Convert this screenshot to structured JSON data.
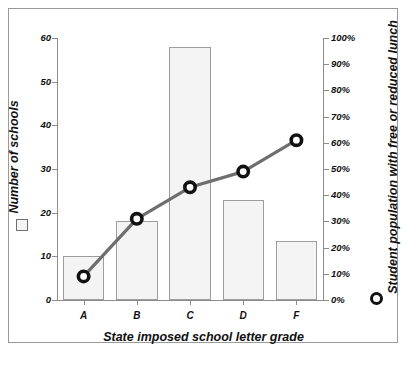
{
  "chart_data": {
    "type": "bar",
    "title": "",
    "categories": [
      "A",
      "B",
      "C",
      "D",
      "F"
    ],
    "xlabel": "State imposed school letter grade",
    "ylabel": "Number of schools",
    "ylabel_right": "Student population with free or reduced lunch",
    "ylim": [
      0,
      60
    ],
    "ylim_right": [
      0,
      100
    ],
    "grid": false,
    "legend_position": "axis-titles",
    "y_ticks": [
      "0",
      "10",
      "20",
      "30",
      "40",
      "50",
      "60"
    ],
    "y_tick_values": [
      0,
      10,
      20,
      30,
      40,
      50,
      60
    ],
    "y_ticks_right": [
      "0%",
      "10%",
      "20%",
      "30%",
      "40%",
      "50%",
      "60%",
      "70%",
      "80%",
      "90%",
      "100%"
    ],
    "y_tick_values_right": [
      0,
      10,
      20,
      30,
      40,
      50,
      60,
      70,
      80,
      90,
      100
    ],
    "series": [
      {
        "name": "Number of schools",
        "type": "bar",
        "axis": "left",
        "marker": "square",
        "color": "#f4f4f4",
        "edge_color": "#9d9d9d",
        "values": [
          10,
          18,
          58,
          23,
          13.5
        ]
      },
      {
        "name": "Student population with free or reduced lunch",
        "type": "line",
        "axis": "right",
        "marker": "circle",
        "color": "#6e6e6e",
        "marker_color": "#111111",
        "values": [
          9,
          31,
          43,
          49,
          61
        ]
      }
    ]
  },
  "legend": {
    "bar_marker": "square-marker-icon",
    "line_marker": "circle-marker-icon"
  }
}
